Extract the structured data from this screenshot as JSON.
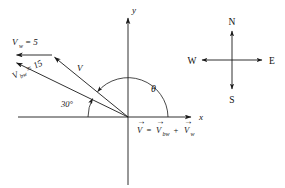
{
  "figure": {
    "background_color": "#ffffff",
    "ink_color": "#1a1a1a"
  },
  "axes": {
    "x_label": "x",
    "y_label": "y",
    "origin": {
      "x": 128,
      "y": 117
    }
  },
  "vectors": [
    {
      "key": "v_w",
      "label_base": "V",
      "label_sub": "w",
      "label_eq": "= 5",
      "magnitude": 5,
      "description": "wind velocity, horizontal pointing west (left)"
    },
    {
      "key": "v_bw",
      "label_base": "V",
      "label_sub": "bw",
      "label_eq": "= 15",
      "magnitude": 15,
      "description": "boat velocity relative to water, 30 degrees above negative x axis"
    },
    {
      "key": "v_resultant",
      "label_base": "V",
      "label_sub": "",
      "label_eq": "",
      "magnitude": null,
      "description": "resultant velocity vector"
    }
  ],
  "angles": {
    "thirty": "30°",
    "theta": "θ"
  },
  "equation": {
    "lhs": "V",
    "eq": "=",
    "term1_base": "V",
    "term1_sub": "bw",
    "plus": "+",
    "term2_base": "V",
    "term2_sub": "w",
    "vector_bar": "→"
  },
  "compass": {
    "north": "N",
    "south": "S",
    "east": "E",
    "west": "W",
    "center": {
      "x": 232,
      "y": 60
    }
  }
}
